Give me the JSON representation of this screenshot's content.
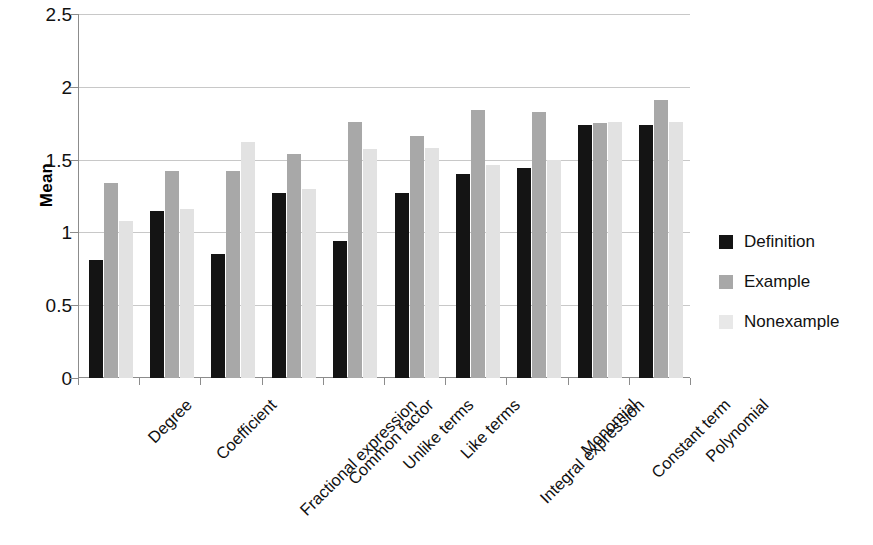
{
  "chart_data": {
    "type": "bar",
    "title": "",
    "xlabel": "",
    "ylabel": "Mean",
    "ylim": [
      0,
      2.5
    ],
    "y_ticks": [
      "0",
      "0.5",
      "1",
      "1.5",
      "2",
      "2.5"
    ],
    "y_tick_values": [
      0,
      0.5,
      1,
      1.5,
      2,
      2.5
    ],
    "grid": true,
    "legend_position": "right",
    "categories": [
      "Degree",
      "Coefficient",
      "Fractional expression",
      "Common factor",
      "Unlike terms",
      "Like terms",
      "Integral expression",
      "Monomial",
      "Constant term",
      "Polynomial"
    ],
    "series": [
      {
        "name": "Definition",
        "color": "#141414",
        "values": [
          0.81,
          1.15,
          0.85,
          1.27,
          0.94,
          1.27,
          1.4,
          1.44,
          1.74,
          1.74
        ]
      },
      {
        "name": "Example",
        "color": "#a8a8a8",
        "values": [
          1.34,
          1.42,
          1.42,
          1.54,
          1.76,
          1.66,
          1.84,
          1.83,
          1.75,
          1.91
        ]
      },
      {
        "name": "Nonexample",
        "color": "#e2e2e2",
        "values": [
          1.08,
          1.16,
          1.62,
          1.3,
          1.57,
          1.58,
          1.46,
          1.5,
          1.76,
          1.76
        ]
      }
    ]
  },
  "legend": {
    "items": [
      {
        "label": "Definition",
        "swatch": "definition"
      },
      {
        "label": "Example",
        "swatch": "example"
      },
      {
        "label": "Nonexample",
        "swatch": "nonexample"
      }
    ]
  }
}
